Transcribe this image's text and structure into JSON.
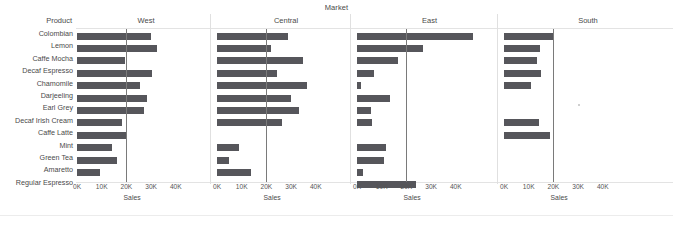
{
  "title": "Market",
  "row_header": "Product",
  "axis_title": "Sales",
  "colors": {
    "bar": "#56565b",
    "reference_line": "#7a7a7a",
    "grid": "#e3e3e3",
    "text": "#4a4a4a"
  },
  "products": [
    "Colombian",
    "Lemon",
    "Caffe Mocha",
    "Decaf Espresso",
    "Chamomile",
    "Darjeeling",
    "Earl Grey",
    "Decaf Irish Cream",
    "Caffe Latte",
    "Mint",
    "Green Tea",
    "Amaretto",
    "Regular Espresso"
  ],
  "panels": [
    {
      "label": "West"
    },
    {
      "label": "Central"
    },
    {
      "label": "East"
    },
    {
      "label": "South"
    }
  ],
  "tick_labels": [
    "0K",
    "10K",
    "20K",
    "30K",
    "40K"
  ],
  "chart_data": {
    "type": "bar",
    "orientation": "horizontal",
    "title": "Market",
    "xlabel": "Sales",
    "ylabel": "Product",
    "xlim": [
      0,
      45000
    ],
    "xticks": [
      0,
      10000,
      20000,
      30000,
      40000
    ],
    "xtick_labels": [
      "0K",
      "10K",
      "20K",
      "30K",
      "40K"
    ],
    "grid": false,
    "legend": false,
    "reference_line": 20000,
    "small_multiples_by": "Market",
    "categories": [
      "Colombian",
      "Lemon",
      "Caffe Mocha",
      "Decaf Espresso",
      "Chamomile",
      "Darjeeling",
      "Earl Grey",
      "Decaf Irish Cream",
      "Caffe Latte",
      "Mint",
      "Green Tea",
      "Amaretto",
      "Regular Espresso"
    ],
    "series": [
      {
        "name": "West",
        "values": [
          29800,
          32200,
          19400,
          30200,
          25400,
          28400,
          27100,
          18300,
          20400,
          14000,
          16200,
          9200,
          null
        ]
      },
      {
        "name": "Central",
        "values": [
          28800,
          21800,
          35000,
          24300,
          36300,
          30100,
          33000,
          26300,
          null,
          8800,
          4700,
          13900,
          null
        ]
      },
      {
        "name": "East",
        "values": [
          47000,
          26700,
          16600,
          6700,
          1600,
          13500,
          5500,
          5900,
          null,
          11900,
          11000,
          2300,
          23800
        ]
      },
      {
        "name": "South",
        "values": [
          19700,
          14700,
          13400,
          15100,
          10800,
          null,
          null,
          14000,
          18600,
          null,
          null,
          null,
          null
        ]
      }
    ]
  }
}
